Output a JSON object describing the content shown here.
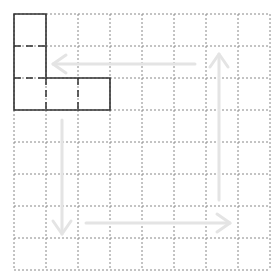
{
  "diagram": {
    "grid": {
      "rows": 8,
      "cols": 8,
      "origin_x": 14,
      "origin_y": 14,
      "cell_size": 32,
      "line_color": "#888888"
    },
    "shape": {
      "name": "L-shape",
      "stroke_color": "#333333",
      "cells": [
        [
          0,
          0
        ],
        [
          0,
          1
        ],
        [
          0,
          2
        ],
        [
          1,
          2
        ],
        [
          2,
          2
        ]
      ],
      "outline_points": "14,14 46,14 46,78 110,78 110,110 14,110"
    },
    "arrows": {
      "color": "#e4e4e4",
      "items": [
        {
          "direction": "left",
          "x1": 195,
          "y1": 64,
          "x2": 53,
          "y2": 64
        },
        {
          "direction": "down",
          "x1": 62,
          "y1": 120,
          "x2": 62,
          "y2": 234
        },
        {
          "direction": "right",
          "x1": 86,
          "y1": 223,
          "x2": 230,
          "y2": 223
        },
        {
          "direction": "up",
          "x1": 219,
          "y1": 200,
          "x2": 219,
          "y2": 54
        }
      ]
    }
  }
}
